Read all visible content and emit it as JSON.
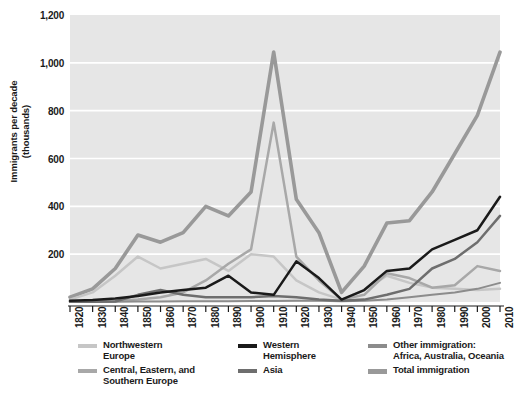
{
  "axes": {
    "ylabel": "Immigrants per decade\n(thousands)",
    "ylabel_line1": "Immigrants per decade",
    "ylabel_line2": "(thousands)",
    "yticks": [
      "1,200",
      "1,000",
      "800",
      "600",
      "400",
      "200"
    ],
    "xticks": [
      "1820",
      "1830",
      "1840",
      "1850",
      "1860",
      "1870",
      "1880",
      "1890",
      "1900",
      "1910",
      "1920",
      "1930",
      "1940",
      "1950",
      "1960",
      "1970",
      "1980",
      "1990",
      "2000",
      "2010"
    ]
  },
  "legend": {
    "items": [
      {
        "label": "Northwestern\nEurope",
        "color": "#c6c6c6",
        "name": "northwestern-europe"
      },
      {
        "label": "Central, Eastern, and\nSouthern Europe",
        "color": "#a8a8a8",
        "name": "central-eastern-southern-europe"
      },
      {
        "label": "Western\nHemisphere",
        "color": "#1a1a1a",
        "name": "western-hemisphere"
      },
      {
        "label": "Asia",
        "color": "#6e6e6e",
        "name": "asia"
      },
      {
        "label": "Other immigration:\nAfrica, Australia, Oceania",
        "color": "#8c8c8c",
        "name": "other-immigration"
      },
      {
        "label": "Total immigration",
        "color": "#999999",
        "name": "total-immigration"
      }
    ]
  },
  "caption": "",
  "chart_data": {
    "type": "line",
    "title": "",
    "xlabel": "",
    "ylabel": "Immigrants per decade (thousands)",
    "xlim": [
      1820,
      2010
    ],
    "ylim": [
      0,
      1200
    ],
    "grid": true,
    "grid_color": "#ffffff",
    "plot_background": "#e6e6e6",
    "legend_position": "bottom",
    "x": [
      1820,
      1830,
      1840,
      1850,
      1860,
      1870,
      1880,
      1890,
      1900,
      1910,
      1920,
      1930,
      1940,
      1950,
      1960,
      1970,
      1980,
      1990,
      2000,
      2010
    ],
    "series": [
      {
        "name": "Northwestern Europe",
        "color": "#c6c6c6",
        "width": 2.5,
        "values": [
          10,
          40,
          110,
          190,
          140,
          160,
          180,
          130,
          200,
          190,
          90,
          40,
          10,
          50,
          110,
          80,
          60,
          55,
          50,
          55
        ]
      },
      {
        "name": "Central, Eastern, and Southern Europe",
        "color": "#a8a8a8",
        "width": 2.5,
        "values": [
          2,
          3,
          5,
          10,
          20,
          40,
          90,
          160,
          220,
          750,
          190,
          90,
          10,
          30,
          120,
          100,
          60,
          70,
          150,
          130
        ]
      },
      {
        "name": "Western Hemisphere",
        "color": "#1a1a1a",
        "width": 2.5,
        "values": [
          5,
          8,
          15,
          25,
          40,
          50,
          60,
          110,
          40,
          30,
          170,
          100,
          10,
          50,
          130,
          140,
          220,
          260,
          300,
          440
        ]
      },
      {
        "name": "Asia",
        "color": "#6e6e6e",
        "width": 2.5,
        "values": [
          1,
          1,
          2,
          30,
          50,
          30,
          20,
          20,
          20,
          25,
          20,
          10,
          5,
          10,
          30,
          55,
          140,
          180,
          250,
          360
        ]
      },
      {
        "name": "Other immigration: Africa, Australia, Oceania",
        "color": "#8c8c8c",
        "width": 2.0,
        "values": [
          1,
          1,
          1,
          2,
          2,
          3,
          3,
          3,
          4,
          4,
          5,
          5,
          3,
          5,
          10,
          20,
          30,
          40,
          55,
          80
        ]
      },
      {
        "name": "Total immigration",
        "color": "#999999",
        "width": 3.6,
        "values": [
          20,
          55,
          140,
          280,
          250,
          290,
          400,
          360,
          460,
          1045,
          430,
          290,
          40,
          150,
          330,
          340,
          460,
          620,
          780,
          1045
        ]
      }
    ]
  }
}
